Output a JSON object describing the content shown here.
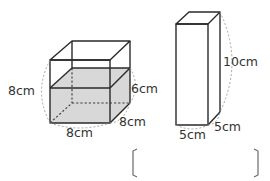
{
  "figure": {
    "left_solid": {
      "type": "cube-container-with-water",
      "labels": {
        "height": "8cm",
        "water_depth": "6cm",
        "width": "8cm",
        "depth": "8cm"
      },
      "colors": {
        "water": "#d8d8d8",
        "edge": "#2a2a2a"
      }
    },
    "right_solid": {
      "type": "rectangular-prism",
      "labels": {
        "height": "10cm",
        "width": "5cm",
        "depth": "5cm"
      }
    },
    "answer_box": {
      "left_bracket": "(",
      "right_bracket": ")",
      "value": ""
    }
  }
}
